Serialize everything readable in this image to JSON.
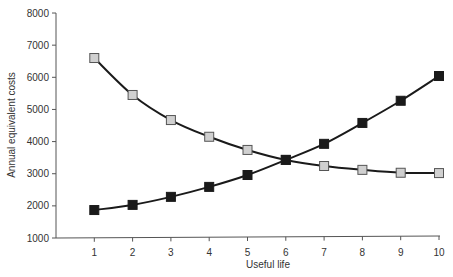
{
  "chart_data": {
    "type": "line",
    "title": "",
    "xlabel": "Useful life",
    "ylabel": "Annual equivalent costs",
    "x": [
      1,
      2,
      3,
      4,
      5,
      6,
      7,
      8,
      9,
      10
    ],
    "xlim": [
      0,
      10
    ],
    "ylim": [
      1000,
      8000
    ],
    "yticks": [
      1000,
      2000,
      3000,
      4000,
      5000,
      6000,
      7000,
      8000
    ],
    "xticks": [
      1,
      2,
      3,
      4,
      5,
      6,
      7,
      8,
      9,
      10
    ],
    "grid": false,
    "legend": null,
    "series": [
      {
        "name": "Decreasing cost (open squares)",
        "marker": "square-open",
        "color": "#cccccc",
        "values": [
          6600,
          5450,
          4670,
          4150,
          3740,
          3430,
          3240,
          3120,
          3030,
          3020
        ]
      },
      {
        "name": "Increasing cost (filled squares)",
        "marker": "square-filled",
        "color": "#1a1a1a",
        "values": [
          1870,
          2030,
          2280,
          2590,
          2960,
          3430,
          3930,
          4580,
          5270,
          6040
        ]
      }
    ]
  }
}
